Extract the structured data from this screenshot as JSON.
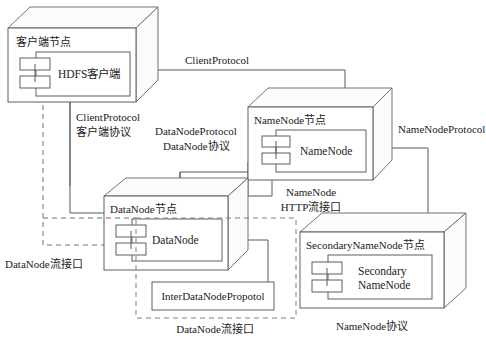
{
  "diagram": {
    "nodes": [
      {
        "id": "client",
        "node_label": "客户端节点",
        "component_label": "HDFS客户端"
      },
      {
        "id": "namenode",
        "node_label": "NameNode节点",
        "component_label": "NameNode"
      },
      {
        "id": "datanode",
        "node_label": "DataNode节点",
        "component_label": "DataNode"
      },
      {
        "id": "secondary",
        "node_label": "SecondaryNameNode节点",
        "component_label_line1": "Secondary",
        "component_label_line2": "NameNode"
      }
    ],
    "connector_labels": {
      "client_protocol_top": "ClientProtocol",
      "client_protocol_line1": "ClientProtocol",
      "client_protocol_line2": "客户端协议",
      "datanode_protocol_line1": "DataNodeProtocol",
      "datanode_protocol_line2": "DataNode协议",
      "namenode_protocol": "NameNodeProtocol",
      "namenode_http_line1": "NameNode",
      "namenode_http_line2": "HTTP流接口",
      "datanode_stream_left": "DataNode流接口",
      "datanode_stream_bottom": "DataNode流接口",
      "inter_datanode_protocol": "InterDataNodePropotol",
      "namenode_protocol_cn": "NameNode协议"
    },
    "colors": {
      "line": "#5a6063",
      "dashed": "#7b8184",
      "text": "#1d2122",
      "background": "#ffffff"
    }
  }
}
